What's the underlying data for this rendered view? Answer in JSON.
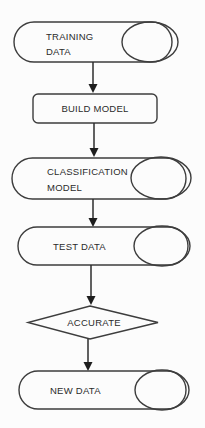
{
  "diagram": {
    "type": "flowchart",
    "background_color": "#fcfcfc",
    "outline_color": "#3d3d3d",
    "arrow_color": "#1e1e1e",
    "text_color": "#2b2b2b",
    "nodes": [
      {
        "id": "training-data",
        "shape": "stadium-with-ellipse",
        "lines": {
          "0": "TRAINING",
          "1": "DATA"
        }
      },
      {
        "id": "build-model",
        "shape": "rounded-rectangle",
        "lines": {
          "0": "BUILD MODEL"
        }
      },
      {
        "id": "classification-model",
        "shape": "stadium-with-ellipse",
        "lines": {
          "0": "CLASSIFICATION",
          "1": "MODEL"
        }
      },
      {
        "id": "test-data",
        "shape": "stadium-with-ellipse",
        "lines": {
          "0": "TEST DATA"
        }
      },
      {
        "id": "accurate",
        "shape": "diamond",
        "lines": {
          "0": "ACCURATE"
        }
      },
      {
        "id": "new-data",
        "shape": "stadium-with-ellipse",
        "lines": {
          "0": "NEW DATA"
        }
      }
    ],
    "edges": [
      {
        "from": "training-data",
        "to": "build-model"
      },
      {
        "from": "build-model",
        "to": "classification-model"
      },
      {
        "from": "classification-model",
        "to": "test-data"
      },
      {
        "from": "test-data",
        "to": "accurate"
      },
      {
        "from": "accurate",
        "to": "new-data"
      }
    ]
  }
}
